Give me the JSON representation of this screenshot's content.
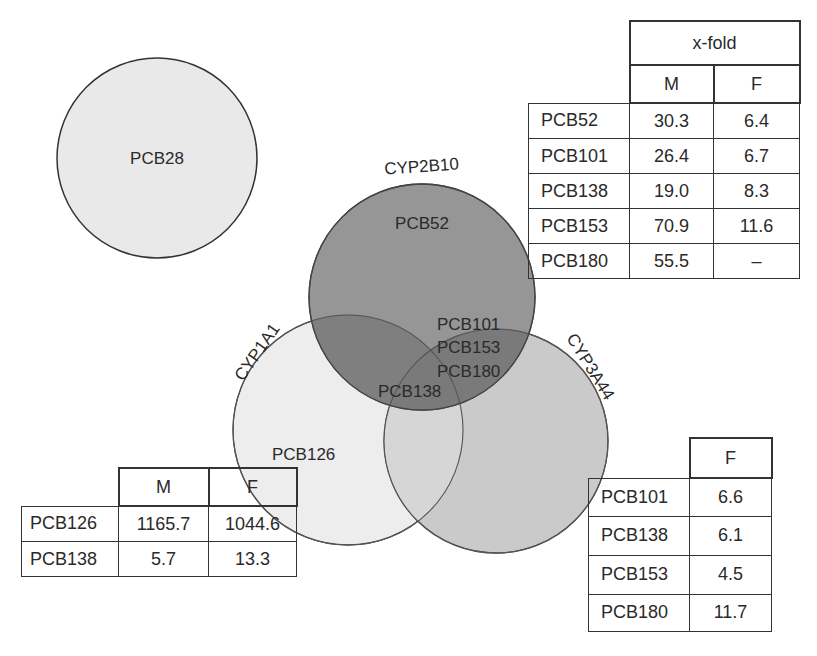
{
  "diagram": {
    "type": "venn",
    "sets": [
      {
        "id": "pcb28-set",
        "label": "",
        "members": [
          "PCB28"
        ],
        "fill": "#e8e8e8"
      },
      {
        "id": "cyp2b10",
        "label": "CYP2B10",
        "fill": "#8f8f8f"
      },
      {
        "id": "cyp1a1",
        "label": "CYP1A1",
        "fill": "#ececec"
      },
      {
        "id": "cyp3a44",
        "label": "CYP3A44",
        "fill": "#c4c4c4"
      }
    ],
    "region_labels": {
      "pcb28": "PCB28",
      "cyp2b10_only": "PCB52",
      "cyp2b10_cyp3a44": [
        "PCB101",
        "PCB153",
        "PCB180"
      ],
      "all_three": "PCB138",
      "cyp1a1_only": "PCB126"
    },
    "circle_labels": {
      "cyp2b10": "CYP2B10",
      "cyp1a1": "CYP1A1",
      "cyp3a44": "CYP3A44"
    }
  },
  "tables": {
    "cyp2b10_table": {
      "group_header": "x-fold",
      "columns": [
        "M",
        "F"
      ],
      "rows": [
        {
          "name": "PCB52",
          "M": "30.3",
          "F": "6.4"
        },
        {
          "name": "PCB101",
          "M": "26.4",
          "F": "6.7"
        },
        {
          "name": "PCB138",
          "M": "19.0",
          "F": "8.3"
        },
        {
          "name": "PCB153",
          "M": "70.9",
          "F": "11.6"
        },
        {
          "name": "PCB180",
          "M": "55.5",
          "F": "–"
        }
      ]
    },
    "cyp1a1_table": {
      "columns": [
        "M",
        "F"
      ],
      "rows": [
        {
          "name": "PCB126",
          "M": "1165.7",
          "F": "1044.6"
        },
        {
          "name": "PCB138",
          "M": "5.7",
          "F": "13.3"
        }
      ]
    },
    "cyp3a44_table": {
      "columns": [
        "F"
      ],
      "rows": [
        {
          "name": "PCB101",
          "F": "6.6"
        },
        {
          "name": "PCB138",
          "F": "6.1"
        },
        {
          "name": "PCB153",
          "F": "4.5"
        },
        {
          "name": "PCB180",
          "F": "11.7"
        }
      ]
    }
  }
}
